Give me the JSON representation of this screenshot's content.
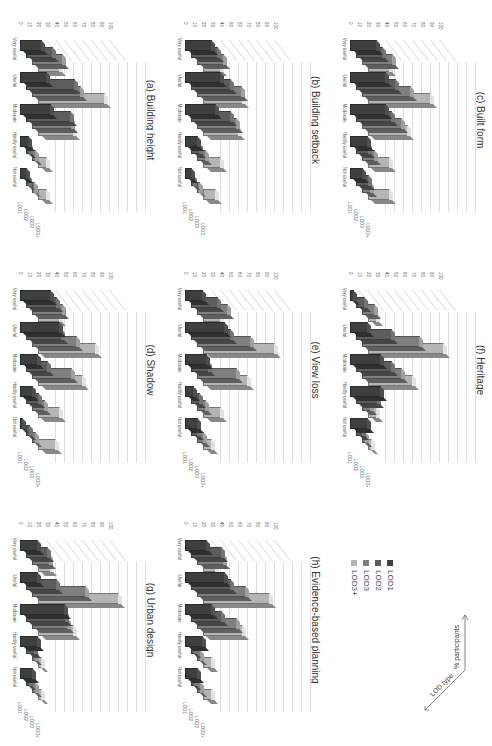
{
  "page": {
    "orientation": "rotated 90deg clockwise"
  },
  "legend": {
    "items": [
      {
        "label": "LOD1",
        "color": "#3f3f3f"
      },
      {
        "label": "LOD2",
        "color": "#5d5d5d"
      },
      {
        "label": "LOD3",
        "color": "#7f7f7f"
      },
      {
        "label": "LOD3+",
        "color": "#b5b5b5"
      }
    ],
    "axis_y": "% participants",
    "axis_z": "LOD type"
  },
  "chart_data": [
    {
      "id": "a",
      "type": "bar",
      "title": "(a) Building height",
      "categories": [
        "Very useful",
        "Useful",
        "Moderate",
        "Hardly useful",
        "Not useful"
      ],
      "ylim": [
        0,
        100
      ],
      "yticks": [
        "0",
        "10",
        "20",
        "30",
        "40",
        "50",
        "60",
        "70",
        "80",
        "90",
        "100"
      ],
      "zlabels": [
        "LOD1",
        "LOD2",
        "LOD3",
        "LOD3+"
      ],
      "series": [
        {
          "name": "LOD1",
          "values": [
            25,
            30,
            35,
            10,
            8
          ]
        },
        {
          "name": "LOD2",
          "values": [
            30,
            55,
            50,
            5,
            3
          ]
        },
        {
          "name": "LOD3",
          "values": [
            35,
            55,
            45,
            5,
            3
          ]
        },
        {
          "name": "LOD3+",
          "values": [
            25,
            75,
            40,
            10,
            10
          ]
        }
      ]
    },
    {
      "id": "b",
      "type": "bar",
      "title": "(b) Building setback",
      "categories": [
        "Very useful",
        "Useful",
        "Moderate",
        "Hardly useful",
        "Not useful"
      ],
      "ylim": [
        0,
        100
      ],
      "yticks": [
        "0",
        "10",
        "20",
        "30",
        "40",
        "50",
        "60",
        "70",
        "80",
        "90",
        "100"
      ],
      "zlabels": [
        "LOD1",
        "LOD2",
        "LOD3",
        "LOD3..."
      ],
      "series": [
        {
          "name": "LOD1",
          "values": [
            30,
            40,
            35,
            15,
            8
          ]
        },
        {
          "name": "LOD2",
          "values": [
            30,
            45,
            45,
            10,
            3
          ]
        },
        {
          "name": "LOD3",
          "values": [
            30,
            50,
            45,
            10,
            3
          ]
        },
        {
          "name": "LOD3+",
          "values": [
            20,
            45,
            40,
            20,
            15
          ]
        }
      ]
    },
    {
      "id": "c",
      "type": "bar",
      "title": "(c) Built form",
      "categories": [
        "Very useful",
        "Useful",
        "Moderate",
        "Hardly useful",
        "Not useful"
      ],
      "ylim": [
        0,
        100
      ],
      "yticks": [
        "0",
        "10",
        "20",
        "30",
        "40",
        "50",
        "60",
        "70",
        "80",
        "90",
        "100"
      ],
      "zlabels": [
        "LOD1",
        "LOD2",
        "LOD3",
        "LOD3+"
      ],
      "series": [
        {
          "name": "LOD1",
          "values": [
            30,
            40,
            40,
            20,
            15
          ]
        },
        {
          "name": "LOD2",
          "values": [
            30,
            45,
            40,
            15,
            15
          ]
        },
        {
          "name": "LOD3",
          "values": [
            35,
            55,
            45,
            15,
            10
          ]
        },
        {
          "name": "LOD3+",
          "values": [
            25,
            70,
            45,
            25,
            25
          ]
        }
      ]
    },
    {
      "id": "d",
      "type": "bar",
      "title": "(d) Shadow",
      "categories": [
        "Very useful",
        "Useful",
        "Moderate",
        "Hardly useful",
        "Not useful"
      ],
      "ylim": [
        0,
        100
      ],
      "yticks": [
        "0",
        "10",
        "20",
        "30",
        "40",
        "50",
        "60",
        "70",
        "80",
        "90",
        "100"
      ],
      "zlabels": [
        "LOD1",
        "LOD2",
        "LOD3",
        "LOD3+"
      ],
      "series": [
        {
          "name": "LOD1",
          "values": [
            35,
            45,
            20,
            15,
            3
          ]
        },
        {
          "name": "LOD2",
          "values": [
            35,
            40,
            25,
            15,
            5
          ]
        },
        {
          "name": "LOD3",
          "values": [
            35,
            50,
            45,
            15,
            5
          ]
        },
        {
          "name": "LOD3+",
          "values": [
            25,
            65,
            50,
            25,
            20
          ]
        }
      ]
    },
    {
      "id": "e",
      "type": "bar",
      "title": "(e) View loss",
      "categories": [
        "Very useful",
        "Useful",
        "Moderate",
        "Hardly useful",
        "Not useful"
      ],
      "ylim": [
        0,
        100
      ],
      "yticks": [
        "0",
        "10",
        "20",
        "30",
        "40",
        "50",
        "60",
        "70",
        "80",
        "90",
        "100"
      ],
      "zlabels": [
        "LOD1",
        "LOD2",
        "LOD3",
        "LOD3+"
      ],
      "series": [
        {
          "name": "LOD1",
          "values": [
            20,
            45,
            25,
            10,
            15
          ]
        },
        {
          "name": "LOD2",
          "values": [
            30,
            45,
            20,
            10,
            8
          ]
        },
        {
          "name": "LOD3",
          "values": [
            35,
            60,
            45,
            10,
            8
          ]
        },
        {
          "name": "LOD3+",
          "values": [
            20,
            80,
            50,
            20,
            10
          ]
        }
      ]
    },
    {
      "id": "f",
      "type": "bar",
      "title": "(f) Heritage",
      "categories": [
        "Very useful",
        "Useful",
        "Moderate",
        "Hardly useful",
        "Not useful"
      ],
      "ylim": [
        0,
        100
      ],
      "yticks": [
        "0",
        "10",
        "20",
        "30",
        "40",
        "50",
        "60",
        "70",
        "80",
        "90",
        "100"
      ],
      "zlabels": [
        "LOD1",
        "LOD2",
        "LOD3",
        "LOD3+"
      ],
      "series": [
        {
          "name": "LOD1",
          "values": [
            5,
            20,
            35,
            35,
            20
          ]
        },
        {
          "name": "LOD2",
          "values": [
            10,
            40,
            40,
            25,
            8
          ]
        },
        {
          "name": "LOD3",
          "values": [
            15,
            65,
            45,
            10,
            5
          ]
        },
        {
          "name": "LOD3+",
          "values": [
            10,
            85,
            50,
            10,
            5
          ]
        }
      ]
    },
    {
      "id": "g",
      "type": "bar",
      "title": "(g) Urban design",
      "categories": [
        "Very useful",
        "Useful",
        "Moderate",
        "Hardly useful",
        "Not useful"
      ],
      "ylim": [
        0,
        100
      ],
      "yticks": [
        "0",
        "10",
        "20",
        "30",
        "40",
        "50",
        "60",
        "70",
        "80",
        "90",
        "100"
      ],
      "zlabels": [
        "LOD1",
        "LOD2",
        "LOD3",
        "LOD3+"
      ],
      "series": [
        {
          "name": "LOD1",
          "values": [
            20,
            20,
            50,
            20,
            15
          ]
        },
        {
          "name": "LOD2",
          "values": [
            25,
            35,
            45,
            10,
            5
          ]
        },
        {
          "name": "LOD3",
          "values": [
            20,
            60,
            40,
            5,
            5
          ]
        },
        {
          "name": "LOD3+",
          "values": [
            15,
            90,
            40,
            5,
            5
          ]
        }
      ]
    },
    {
      "id": "h",
      "type": "bar",
      "title": "(h) Evidence-based planning",
      "categories": [
        "Very useful",
        "Useful",
        "Moderate",
        "Hardly useful",
        "Not useful"
      ],
      "ylim": [
        0,
        100
      ],
      "yticks": [
        "0",
        "10",
        "20",
        "30",
        "40",
        "50",
        "60",
        "70",
        "80",
        "90",
        "100"
      ],
      "zlabels": [
        "LOD1",
        "LOD2",
        "LOD3",
        "LOD3+"
      ],
      "series": [
        {
          "name": "LOD1",
          "values": [
            25,
            45,
            30,
            20,
            15
          ]
        },
        {
          "name": "LOD2",
          "values": [
            35,
            45,
            35,
            5,
            5
          ]
        },
        {
          "name": "LOD3",
          "values": [
            30,
            55,
            45,
            5,
            5
          ]
        },
        {
          "name": "LOD3+",
          "values": [
            15,
            75,
            45,
            10,
            10
          ]
        }
      ]
    }
  ]
}
